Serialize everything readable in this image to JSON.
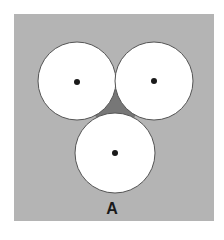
{
  "figure": {
    "label": "A",
    "colors": {
      "background": "#b4b4b4",
      "gap": "#777777",
      "circle_fill": "#ffffff",
      "circle_stroke": "#555555",
      "center_dot": "#1a1a1a"
    },
    "circles": [
      {
        "name": "top-left",
        "cx": 77,
        "cy": 81,
        "r": 39
      },
      {
        "name": "top-right",
        "cx": 154,
        "cy": 81,
        "r": 39
      },
      {
        "name": "bottom",
        "cx": 115,
        "cy": 153,
        "r": 40
      }
    ]
  }
}
